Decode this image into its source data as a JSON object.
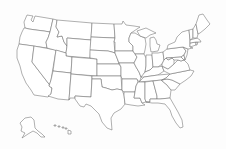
{
  "map": {
    "title": "United States",
    "type": "outline-map",
    "colors": {
      "background": "#fdfdfd",
      "state_fill": "#ffffff",
      "border": "#6e6e6e"
    },
    "states": [
      {
        "id": "WA",
        "name": "Washington",
        "d": "M27,15 L33,16 L31,20 L33,22 L35,16 L53,19 L50,32 L44,31 L36,30 L29,29 L25,28 L24,22 Z"
      },
      {
        "id": "OR",
        "name": "Oregon",
        "d": "M24,28 L25,28 L29,29 L36,30 L44,31 L50,32 L48,38 L46,42 L47,48 L19,44 L20,37 L22,32 Z"
      },
      {
        "id": "CA",
        "name": "California",
        "d": "M19,44 L34,46 L32,62 L52,88 L51,94 L48,97 L34,95 L31,90 L26,83 L22,74 L20,66 L17,58 L17,50 Z"
      },
      {
        "id": "NV",
        "name": "Nevada",
        "d": "M34,46 L56,50 L51,80 L49,86 L52,88 L32,62 Z"
      },
      {
        "id": "ID",
        "name": "Idaho",
        "d": "M53,19 L57,20 L56,27 L59,32 L57,37 L62,36 L64,42 L67,46 L66,53 L47,48 L46,42 L48,38 L50,32 Z"
      },
      {
        "id": "MT",
        "name": "Montana",
        "d": "M57,20 L92,23 L91,40 L67,38 L67,46 L64,42 L62,36 L57,37 L59,32 L56,27 Z"
      },
      {
        "id": "WY",
        "name": "Wyoming",
        "d": "M67,38 L91,40 L90,58 L66,56 L66,53 L67,46 Z"
      },
      {
        "id": "UT",
        "name": "Utah",
        "d": "M56,50 L66,53 L66,56 L72,57 L71,73 L53,71 Z"
      },
      {
        "id": "AZ",
        "name": "Arizona",
        "d": "M53,71 L71,73 L69,100 L58,99 L48,96 L51,94 L52,88 L49,86 L51,80 Z"
      },
      {
        "id": "CO",
        "name": "Colorado",
        "d": "M72,57 L97,59 L97,76 L71,74 Z"
      },
      {
        "id": "NM",
        "name": "New Mexico",
        "d": "M71,74 L92,76 L91,97 L75,96 L75,98 L70,98 L69,100 Z"
      },
      {
        "id": "ND",
        "name": "North Dakota",
        "d": "M92,23 L114,24 L115,38 L91,37 Z"
      },
      {
        "id": "SD",
        "name": "South Dakota",
        "d": "M91,37 L115,38 L114,42 L115,53 L112,52 L108,51 L90,50 Z"
      },
      {
        "id": "NE",
        "name": "Nebraska",
        "d": "M90,50 L108,51 L112,52 L115,53 L117,58 L119,64 L97,64 L97,59 L90,58 Z"
      },
      {
        "id": "KS",
        "name": "Kansas",
        "d": "M97,64 L119,64 L121,67 L121,76 L97,76 Z"
      },
      {
        "id": "OK",
        "name": "Oklahoma",
        "d": "M92,76 L121,76 L122,90 L117,89 L112,90 L106,88 L102,87 L101,79 L92,79 Z"
      },
      {
        "id": "TX",
        "name": "Texas",
        "d": "M92,79 L101,79 L102,87 L106,88 L112,90 L117,89 L122,90 L124,95 L125,104 L121,109 L114,113 L111,118 L112,130 L107,128 L102,122 L99,114 L95,110 L91,106 L86,104 L84,107 L80,106 L75,99 L75,96 L91,97 Z"
      },
      {
        "id": "MN",
        "name": "Minnesota",
        "d": "M114,24 L122,24 L123,21 L126,25 L134,26 L140,27 L131,33 L129,38 L129,42 L133,46 L133,51 L115,51 L115,42 L114,42 L115,38 Z"
      },
      {
        "id": "IA",
        "name": "Iowa",
        "d": "M115,51 L133,51 L135,54 L137,57 L134,63 L119,63 L117,58 L115,53 Z"
      },
      {
        "id": "MO",
        "name": "Missouri",
        "d": "M119,63 L134,63 L136,67 L139,72 L141,77 L140,81 L137,81 L137,79 L122,79 L121,76 L121,67 Z"
      },
      {
        "id": "AR",
        "name": "Arkansas",
        "d": "M122,79 L137,79 L138,82 L136,86 L135,92 L124,92 L122,90 Z"
      },
      {
        "id": "LA",
        "name": "Louisiana",
        "d": "M124,92 L135,92 L134,98 L140,98 L142,103 L145,105 L138,106 L131,105 L125,104 L124,95 Z"
      },
      {
        "id": "WI",
        "name": "Wisconsin",
        "d": "M129,38 L131,33 L135,33 L140,36 L145,38 L146,44 L145,50 L144,54 L135,54 L133,51 L133,46 L129,42 Z"
      },
      {
        "id": "IL",
        "name": "Illinois",
        "d": "M135,54 L144,54 L146,58 L146,66 L145,72 L142,77 L141,77 L139,72 L136,67 L134,63 L137,57 Z"
      },
      {
        "id": "MI",
        "name": "Michigan",
        "d": "M137,31 L146,28 L152,31 L156,33 L150,35 L146,38 L140,36 Z M150,38 L154,37 L156,40 L157,44 L160,45 L158,51 L151,52 L150,46 Z"
      },
      {
        "id": "IN",
        "name": "Indiana",
        "d": "M146,55 L152,55 L153,67 L150,70 L145,72 L146,66 Z"
      },
      {
        "id": "OH",
        "name": "Ohio",
        "d": "M152,53 L158,53 L163,52 L164,60 L162,64 L158,67 L153,67 L152,55 Z"
      },
      {
        "id": "KY",
        "name": "Kentucky",
        "d": "M141,77 L145,72 L150,70 L153,67 L158,67 L162,66 L164,71 L158,75 L144,77 Z"
      },
      {
        "id": "TN",
        "name": "Tennessee",
        "d": "M140,81 L144,77 L158,75 L170,74 L166,78 L162,80 L139,82 Z"
      },
      {
        "id": "MS",
        "name": "Mississippi",
        "d": "M138,82 L145,82 L145,99 L146,102 L142,103 L140,98 L134,98 L135,92 L136,86 Z"
      },
      {
        "id": "AL",
        "name": "Alabama",
        "d": "M145,82 L153,81 L157,96 L157,99 L150,99 L150,102 L146,102 L145,99 Z"
      },
      {
        "id": "GA",
        "name": "Georgia",
        "d": "M153,81 L161,80 L167,85 L171,90 L170,98 L160,99 L157,99 L157,96 Z"
      },
      {
        "id": "FL",
        "name": "Florida",
        "d": "M146,102 L150,102 L150,99 L157,99 L160,99 L170,98 L174,105 L178,112 L182,120 L183,127 L180,128 L176,123 L172,116 L170,110 L165,104 L158,103 L152,103 Z"
      },
      {
        "id": "SC",
        "name": "South Carolina",
        "d": "M161,80 L167,79 L172,80 L180,84 L175,90 L171,90 L167,85 Z"
      },
      {
        "id": "NC",
        "name": "North Carolina",
        "d": "M162,80 L166,78 L170,74 L190,70 L194,71 L191,76 L186,80 L180,84 L172,80 L167,79 Z"
      },
      {
        "id": "VA",
        "name": "Virginia",
        "d": "M162,66 L164,71 L170,74 L190,70 L188,64 L184,60 L181,61 L178,60 L174,64 L168,69 Z"
      },
      {
        "id": "WV",
        "name": "West Virginia",
        "d": "M162,64 L164,60 L166,58 L168,60 L172,58 L174,60 L174,64 L168,69 L162,66 Z"
      },
      {
        "id": "PA",
        "name": "Pennsylvania",
        "d": "M163,52 L167,49 L183,47 L186,51 L184,55 L181,57 L166,58 L164,60 Z"
      },
      {
        "id": "MD",
        "name": "Maryland",
        "d": "M166,58 L181,57 L184,60 L181,61 L178,60 L174,60 L172,58 L168,60 Z"
      },
      {
        "id": "DE",
        "name": "Delaware",
        "d": "M181,57 L184,55 L185,60 L184,60 Z"
      },
      {
        "id": "NJ",
        "name": "New Jersey",
        "d": "M183,47 L188,49 L187,55 L185,60 L184,55 L186,51 Z"
      },
      {
        "id": "NY",
        "name": "New York",
        "d": "M167,49 L168,45 L175,42 L177,37 L182,32 L189,30 L190,40 L190,47 L193,48 L188,49 L183,47 Z"
      },
      {
        "id": "CT",
        "name": "Connecticut",
        "d": "M190,43 L196,42 L196,45 L190,47 Z"
      },
      {
        "id": "RI",
        "name": "Rhode Island",
        "d": "M196,42 L198,42 L197,45 L196,45 Z"
      },
      {
        "id": "MA",
        "name": "Massachusetts",
        "d": "M190,40 L197,38 L200,40 L201,42 L196,42 L190,43 Z"
      },
      {
        "id": "VT",
        "name": "Vermont",
        "d": "M189,30 L193,29 L193,38 L190,40 Z"
      },
      {
        "id": "NH",
        "name": "New Hampshire",
        "d": "M193,29 L196,24 L198,34 L197,38 L193,38 Z"
      },
      {
        "id": "ME",
        "name": "Maine",
        "d": "M196,24 L199,15 L203,14 L207,20 L210,24 L205,29 L200,33 L198,34 Z"
      },
      {
        "id": "AK",
        "name": "Alaska",
        "d": "M25,118 L31,117 L34,120 L35,128 L38,131 L42,134 L45,137 L41,137 L37,133 L33,131 L28,134 L22,138 L25,133 L21,131 L22,127 L20,123 Z"
      },
      {
        "id": "HI",
        "name": "Hawaii",
        "d": "M54,125 L56,125 L56,126 L54,126 Z M58,126 L60,126 L60,127 L58,127 Z M62,127 L64,127 L64,128 L62,128 Z M65,128 L67,128 L67,129 L65,129 Z M68,130 L71,131 L71,134 L68,134 Z"
      }
    ]
  }
}
